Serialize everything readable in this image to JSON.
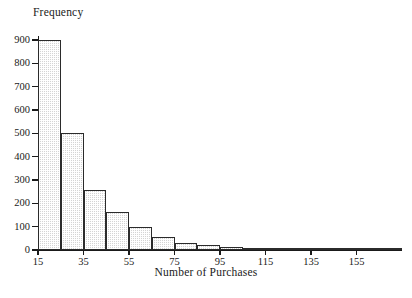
{
  "chart_data": {
    "type": "bar",
    "title": "",
    "subtitle": "",
    "xlabel": "Number of Purchases",
    "ylabel": "Frequency",
    "ylim": [
      0,
      900
    ],
    "xlim": [
      15,
      175
    ],
    "bin_width": 10,
    "grid": false,
    "legend": null,
    "y_ticks": [
      0,
      100,
      200,
      300,
      400,
      500,
      600,
      700,
      800,
      900
    ],
    "y_tick_labels": [
      "0",
      "100",
      "200",
      "300",
      "400",
      "500",
      "600",
      "700",
      "800",
      "900"
    ],
    "x_ticks": [
      15,
      35,
      55,
      75,
      95,
      115,
      135,
      155
    ],
    "x_tick_labels": [
      "15",
      "35",
      "55",
      "75",
      "95",
      "115",
      "135",
      "155"
    ],
    "bins": [
      {
        "left": 15,
        "right": 25,
        "value": 900
      },
      {
        "left": 25,
        "right": 35,
        "value": 500
      },
      {
        "left": 35,
        "right": 45,
        "value": 258
      },
      {
        "left": 45,
        "right": 55,
        "value": 165
      },
      {
        "left": 55,
        "right": 65,
        "value": 97
      },
      {
        "left": 65,
        "right": 75,
        "value": 55
      },
      {
        "left": 75,
        "right": 85,
        "value": 30
      },
      {
        "left": 85,
        "right": 95,
        "value": 22
      },
      {
        "left": 95,
        "right": 105,
        "value": 14
      },
      {
        "left": 105,
        "right": 115,
        "value": 10
      },
      {
        "left": 115,
        "right": 125,
        "value": 6
      },
      {
        "left": 125,
        "right": 135,
        "value": 5
      },
      {
        "left": 135,
        "right": 145,
        "value": 4
      },
      {
        "left": 145,
        "right": 155,
        "value": 3
      },
      {
        "left": 155,
        "right": 165,
        "value": 2
      },
      {
        "left": 165,
        "right": 175,
        "value": 2
      }
    ],
    "categories": [
      "15-25",
      "25-35",
      "35-45",
      "45-55",
      "55-65",
      "65-75",
      "75-85",
      "85-95",
      "95-105",
      "105-115",
      "115-125",
      "125-135",
      "135-145",
      "145-155",
      "155-165",
      "165-175"
    ],
    "values": [
      900,
      500,
      258,
      165,
      97,
      55,
      30,
      22,
      14,
      10,
      6,
      5,
      4,
      3,
      2,
      2
    ],
    "colors": {
      "bar_fill": "#d4d4d4",
      "bar_edge": "#2b2b2b",
      "axis": "#1a1a1a",
      "background": "#ffffff"
    }
  }
}
